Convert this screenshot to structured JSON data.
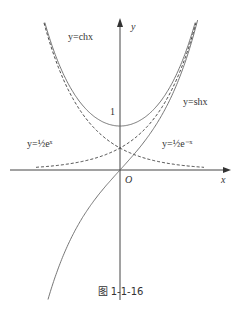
{
  "figure": {
    "caption": "图 1-1-16",
    "axis_x_label": "x",
    "axis_y_label": "y",
    "origin_label": "O",
    "tick_one_label": "1",
    "labels": {
      "ch": "y=chx",
      "sh": "y=shx",
      "half_ex": "y=½eˣ",
      "half_emx": "y=½e⁻ˣ"
    },
    "curves": [
      {
        "name": "y = ch x",
        "style": "solid"
      },
      {
        "name": "y = sh x",
        "style": "solid"
      },
      {
        "name": "y = (1/2)e^x",
        "style": "dashed"
      },
      {
        "name": "y = (1/2)e^-x",
        "style": "dashed"
      }
    ],
    "colors": {
      "line": "#444444",
      "background": "#ffffff"
    }
  }
}
